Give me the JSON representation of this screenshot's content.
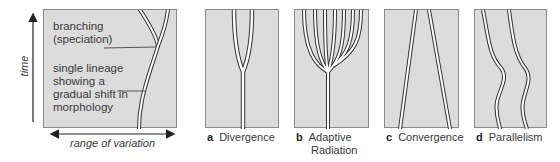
{
  "key_panel": {
    "annotations": {
      "branching": [
        "branching",
        "(speciation)"
      ],
      "lineage": [
        "single lineage",
        "showing a",
        "gradual shift in",
        "morphology"
      ]
    },
    "axes": {
      "y_label": "time",
      "x_label": "range of variation"
    }
  },
  "panels": [
    {
      "letter": "a",
      "title": "Divergence"
    },
    {
      "letter": "b",
      "title": "Adaptive",
      "title2": "Radiation"
    },
    {
      "letter": "c",
      "title": "Convergence"
    },
    {
      "letter": "d",
      "title": "Parallelism"
    }
  ],
  "colors": {
    "panel_fill": "#dcdcdc",
    "panel_border": "#8a8a8a",
    "lineage_outline": "#333333",
    "lineage_fill": "#ffffff"
  }
}
